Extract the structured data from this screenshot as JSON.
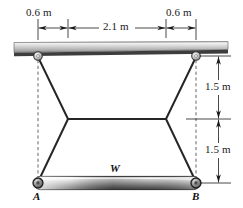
{
  "figure": {
    "colors": {
      "line": "#1a1a1a",
      "member": "#2b2b2b",
      "dashed": "#4d4d4d",
      "beam_light": "#e8e8e8",
      "beam_mid": "#bdbdbd",
      "beam_dark": "#5a5a5a",
      "bar_light": "#f2f2f2",
      "bar_mid": "#9a9a9a",
      "bar_dark": "#3a3a3a",
      "text": "#111111",
      "background": "#ffffff"
    },
    "dimensions": {
      "top_left": "0.6 m",
      "top_middle": "2.1 m",
      "top_right": "0.6 m",
      "right_upper": "1.5 m",
      "right_lower": "1.5 m"
    },
    "labels": {
      "point_a": "A",
      "point_b": "B",
      "load": "W"
    },
    "geometry": {
      "ceiling": {
        "x1": 14,
        "x2": 228,
        "y_top": 42,
        "y_bottom": 53
      },
      "pin_top_left": {
        "x": 38,
        "y": 56
      },
      "pin_top_right": {
        "x": 196,
        "y": 56
      },
      "pin_bottom_left": {
        "x": 38,
        "y": 183
      },
      "pin_bottom_right": {
        "x": 196,
        "y": 183
      },
      "joint_left": {
        "x": 68,
        "y": 119
      },
      "joint_right": {
        "x": 166,
        "y": 119
      },
      "dim_line_y": 28,
      "dim_line_x": 218,
      "bar": {
        "x1": 38,
        "x2": 196,
        "y": 183
      }
    }
  }
}
